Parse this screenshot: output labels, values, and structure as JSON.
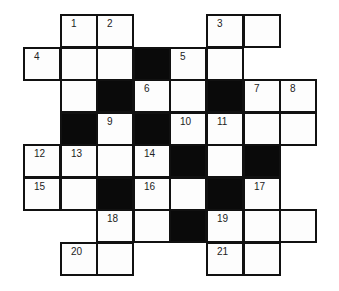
{
  "puzzle": {
    "type": "crossword",
    "rows": 8,
    "cols": 8,
    "cell_width": 36.6,
    "cell_height": 32.5,
    "colors": {
      "white": "#fdfdfd",
      "black": "#0a0a0a",
      "line": "#111111"
    },
    "grid": [
      [
        ".",
        "W",
        "W",
        ".",
        ".",
        "W",
        "W",
        "."
      ],
      [
        "W",
        "W",
        "W",
        "B",
        "W",
        "W",
        ".",
        "."
      ],
      [
        ".",
        "W",
        "B",
        "W",
        "W",
        "B",
        "W",
        "W"
      ],
      [
        ".",
        "B",
        "W",
        "B",
        "W",
        "W",
        "W",
        "W"
      ],
      [
        "W",
        "W",
        "W",
        "W",
        "B",
        "W",
        "B",
        "."
      ],
      [
        "W",
        "W",
        "B",
        "W",
        "W",
        "B",
        "W",
        "."
      ],
      [
        ".",
        ".",
        "W",
        "W",
        "B",
        "W",
        "W",
        "W"
      ],
      [
        ".",
        "W",
        "W",
        ".",
        ".",
        "W",
        "W",
        "."
      ]
    ],
    "numbers": [
      {
        "r": 0,
        "c": 1,
        "n": "1"
      },
      {
        "r": 0,
        "c": 2,
        "n": "2"
      },
      {
        "r": 0,
        "c": 5,
        "n": "3"
      },
      {
        "r": 1,
        "c": 0,
        "n": "4"
      },
      {
        "r": 1,
        "c": 4,
        "n": "5"
      },
      {
        "r": 2,
        "c": 3,
        "n": "6"
      },
      {
        "r": 2,
        "c": 6,
        "n": "7"
      },
      {
        "r": 2,
        "c": 7,
        "n": "8"
      },
      {
        "r": 3,
        "c": 2,
        "n": "9"
      },
      {
        "r": 3,
        "c": 4,
        "n": "10"
      },
      {
        "r": 3,
        "c": 5,
        "n": "11"
      },
      {
        "r": 4,
        "c": 0,
        "n": "12"
      },
      {
        "r": 4,
        "c": 1,
        "n": "13"
      },
      {
        "r": 4,
        "c": 3,
        "n": "14"
      },
      {
        "r": 5,
        "c": 0,
        "n": "15"
      },
      {
        "r": 5,
        "c": 3,
        "n": "16"
      },
      {
        "r": 5,
        "c": 6,
        "n": "17"
      },
      {
        "r": 6,
        "c": 2,
        "n": "18"
      },
      {
        "r": 6,
        "c": 5,
        "n": "19"
      },
      {
        "r": 7,
        "c": 1,
        "n": "20"
      },
      {
        "r": 7,
        "c": 5,
        "n": "21"
      }
    ]
  }
}
